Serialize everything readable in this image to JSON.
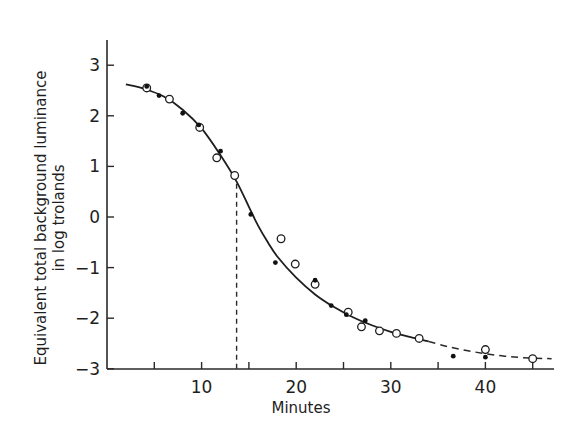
{
  "chart_data": {
    "type": "scatter",
    "title": "",
    "xlabel": "Minutes",
    "ylabel": "Equivalent total background luminance in log trolands",
    "ylabel_lines": [
      "Equivalent total background luminance",
      "in log trolands"
    ],
    "xlim": [
      0,
      47
    ],
    "ylim": [
      -3,
      3.5
    ],
    "x_ticks": [
      5,
      10,
      15,
      20,
      25,
      30,
      35,
      40,
      45
    ],
    "x_tick_labels": [
      {
        "value": 10,
        "label": "10"
      },
      {
        "value": 20,
        "label": "20"
      },
      {
        "value": 30,
        "label": "30"
      },
      {
        "value": 40,
        "label": "40"
      }
    ],
    "y_ticks": [
      {
        "value": 3,
        "label": "3"
      },
      {
        "value": 2,
        "label": "2"
      },
      {
        "value": 1,
        "label": "1"
      },
      {
        "value": 0,
        "label": "0"
      },
      {
        "value": -1,
        "label": "−1"
      },
      {
        "value": -2,
        "label": "−2"
      },
      {
        "value": -3,
        "label": "−3"
      }
    ],
    "grid": false,
    "legend": null,
    "series": [
      {
        "name": "open circles",
        "marker": "open-circle",
        "points": [
          [
            4.2,
            2.55
          ],
          [
            6.6,
            2.33
          ],
          [
            9.8,
            1.77
          ],
          [
            11.6,
            1.17
          ],
          [
            13.5,
            0.82
          ],
          [
            18.4,
            -0.43
          ],
          [
            19.9,
            -0.93
          ],
          [
            22.0,
            -1.33
          ],
          [
            25.5,
            -1.88
          ],
          [
            26.9,
            -2.17
          ],
          [
            28.8,
            -2.25
          ],
          [
            30.6,
            -2.3
          ],
          [
            33.0,
            -2.4
          ],
          [
            40.0,
            -2.62
          ],
          [
            45.0,
            -2.8
          ]
        ]
      },
      {
        "name": "filled circles",
        "marker": "filled-circle",
        "points": [
          [
            4.2,
            2.58
          ],
          [
            5.5,
            2.4
          ],
          [
            8.0,
            2.05
          ],
          [
            9.7,
            1.82
          ],
          [
            12.0,
            1.3
          ],
          [
            15.2,
            0.05
          ],
          [
            17.8,
            -0.9
          ],
          [
            22.0,
            -1.25
          ],
          [
            23.7,
            -1.75
          ],
          [
            25.3,
            -1.93
          ],
          [
            27.3,
            -2.05
          ],
          [
            36.6,
            -2.75
          ],
          [
            40.0,
            -2.77
          ]
        ]
      },
      {
        "name": "fitted curve (solid)",
        "marker": "line",
        "points": [
          [
            2.0,
            2.62
          ],
          [
            4.0,
            2.53
          ],
          [
            6.0,
            2.38
          ],
          [
            8.0,
            2.12
          ],
          [
            10.0,
            1.75
          ],
          [
            12.0,
            1.22
          ],
          [
            13.7,
            0.7
          ],
          [
            15.0,
            0.2
          ],
          [
            16.0,
            -0.18
          ],
          [
            17.0,
            -0.5
          ],
          [
            18.0,
            -0.78
          ],
          [
            20.0,
            -1.2
          ],
          [
            22.0,
            -1.53
          ],
          [
            24.0,
            -1.78
          ],
          [
            26.0,
            -1.98
          ],
          [
            28.0,
            -2.14
          ],
          [
            30.0,
            -2.27
          ],
          [
            32.0,
            -2.37
          ],
          [
            34.0,
            -2.46
          ]
        ]
      },
      {
        "name": "fitted curve (dashed extrapolation)",
        "marker": "dashed-line",
        "points": [
          [
            34.0,
            -2.46
          ],
          [
            36.0,
            -2.56
          ],
          [
            38.0,
            -2.64
          ],
          [
            40.0,
            -2.7
          ],
          [
            42.0,
            -2.75
          ],
          [
            44.0,
            -2.78
          ],
          [
            47.0,
            -2.8
          ]
        ]
      }
    ],
    "annotations": [
      {
        "type": "vertical-dashed-line",
        "x": 13.7,
        "from_y": -3,
        "to_y": 0.7
      }
    ]
  },
  "labels": {
    "xlabel": "Minutes",
    "ylabel_line1": "Equivalent total background luminance",
    "ylabel_line2": "in log trolands"
  }
}
